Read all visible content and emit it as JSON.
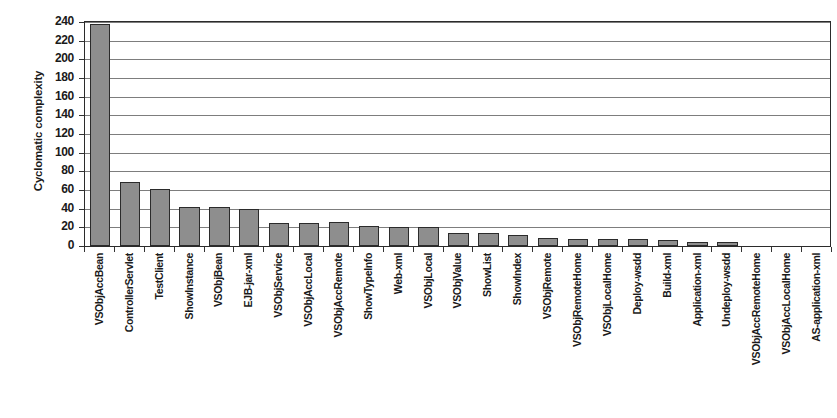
{
  "chart_data": {
    "type": "bar",
    "title": "",
    "xlabel": "",
    "ylabel": "Cyclomatic complexity",
    "ylim": [
      0,
      240
    ],
    "ytick_step": 20,
    "grid": true,
    "legend": "none",
    "bar_color": "#8e8e8e",
    "bar_border_color": "#2b2b2b",
    "axis_color": "#2b2b2b",
    "gridline_color": "#7d7d7d",
    "yticks": [
      0,
      20,
      40,
      60,
      80,
      100,
      120,
      140,
      160,
      180,
      200,
      220,
      240
    ],
    "categories": [
      "VSObjAccBean",
      "ControllerServlet",
      "TestClient",
      "ShowInstance",
      "VSObjBean",
      "EJB-jar-xml",
      "VSObjService",
      "VSObjAccLocal",
      "VSObjAccRemote",
      "ShowTypeInfo",
      "Web-xml",
      "VSObjLocal",
      "VSObjValue",
      "ShowList",
      "ShowIndex",
      "VSObjRemote",
      "VSObjRemoteHome",
      "VSObjLocalHome",
      "Deploy-wsdd",
      "Build-xml",
      "Application-xml",
      "Undeploy-wsdd",
      "VSObjAccRemoteHome",
      "VSObjAccLocalHome",
      "AS-application-xml"
    ],
    "values": [
      238,
      69,
      61,
      42,
      42,
      40,
      25,
      25,
      26,
      21,
      20,
      20,
      14,
      14,
      12,
      9,
      7,
      7,
      7,
      6,
      4,
      4,
      0,
      0,
      0
    ]
  }
}
